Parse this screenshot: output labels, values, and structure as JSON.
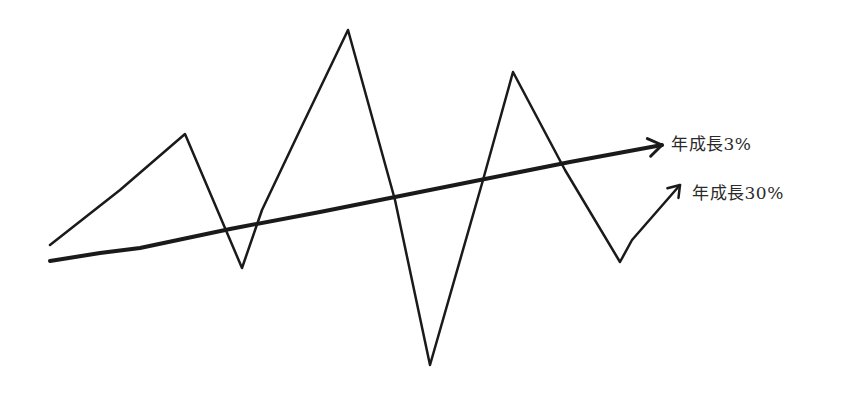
{
  "chart_data": {
    "type": "line",
    "title": "",
    "xlabel": "",
    "ylabel": "",
    "grid": false,
    "axes_visible": false,
    "style": "hand-drawn sketch",
    "series": [
      {
        "name": "年成長3%",
        "description": "steady growth line, gently rising, ends in arrow",
        "points": [
          [
            50,
            261
          ],
          [
            100,
            253
          ],
          [
            140,
            248
          ],
          [
            230,
            229
          ],
          [
            320,
            212
          ],
          [
            395,
            197
          ],
          [
            480,
            180
          ],
          [
            570,
            162
          ],
          [
            662,
            145
          ]
        ],
        "stroke_width": 4
      },
      {
        "name": "年成長30%",
        "description": "volatile zigzag line with large swings, ends in arrow",
        "points": [
          [
            50,
            245
          ],
          [
            120,
            190
          ],
          [
            185,
            134
          ],
          [
            242,
            268
          ],
          [
            262,
            210
          ],
          [
            300,
            130
          ],
          [
            348,
            30
          ],
          [
            395,
            200
          ],
          [
            430,
            365
          ],
          [
            483,
            180
          ],
          [
            513,
            72
          ],
          [
            565,
            170
          ],
          [
            620,
            262
          ],
          [
            632,
            240
          ],
          [
            680,
            185
          ]
        ],
        "stroke_width": 2.5
      }
    ],
    "annotations": [
      {
        "text": "年成長3%",
        "target_series": "年成長3%"
      },
      {
        "text": "年成長30%",
        "target_series": "年成長30%"
      }
    ]
  },
  "labels": {
    "steady": "年成長3%",
    "volatile": "年成長30%"
  },
  "colors": {
    "line": "#1a1a1a",
    "background": "#ffffff"
  }
}
